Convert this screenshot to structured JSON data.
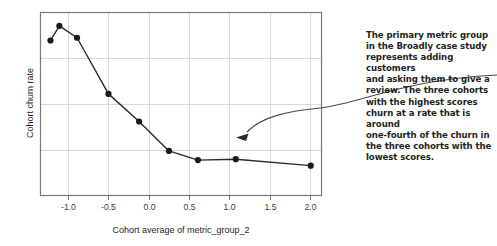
{
  "chart_data": {
    "type": "line",
    "title": "",
    "xlabel": "Cohort average of metric_group_2",
    "ylabel": "Cohort churn rate",
    "xlim": [
      -1.35,
      2.15
    ],
    "ylim": [
      0,
      1
    ],
    "grid": true,
    "legend": null,
    "xticks": [
      "-1.0",
      "-0.5",
      "0.0",
      "0.5",
      "1.0",
      "1.5",
      "2.0"
    ],
    "xtick_values": [
      -1.0,
      -0.5,
      0.0,
      0.5,
      1.0,
      1.5,
      2.0
    ],
    "yticks": [],
    "markers": "filled-circle",
    "marker_color": "#1a1a1a",
    "line_color": "#2b2b2b",
    "series": [
      {
        "name": "cohort churn",
        "x": [
          -1.22,
          -1.11,
          -0.89,
          -0.5,
          -0.12,
          0.25,
          0.61,
          1.08,
          2.01
        ],
        "y": [
          0.845,
          0.925,
          0.86,
          0.555,
          0.405,
          0.245,
          0.195,
          0.2,
          0.165
        ]
      }
    ],
    "annotations": [
      {
        "name": "callout",
        "text": "The primary metric group in the Broadly case study represents adding customers and asking them to give a review. The three cohorts with the highest scores churn at a rate that is around one-fourth of the churn in the three cohorts with the lowest scores.",
        "lines": [
          "The primary metric group",
          "in the Broadly case study",
          "represents adding customers",
          "and asking them to give a",
          "review. The three cohorts",
          "with the highest scores",
          "churn at a rate that is around",
          "one-fourth of the churn in",
          "the three cohorts with the",
          "lowest scores."
        ],
        "arrow_to_x": 1.08,
        "arrow_to_y": 0.32,
        "color": "#231f20"
      }
    ],
    "colors": {
      "background": "#ffffff",
      "grid": "#d9d9d9",
      "frame": "#7a7a7a",
      "text": "#231f20",
      "tick_text": "#3b3b3b",
      "arrow": "#4a4a4a"
    }
  }
}
